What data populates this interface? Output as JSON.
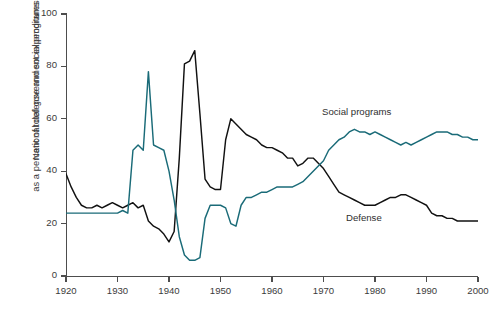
{
  "axes": {
    "ylabel_line1": "National defense and social programs",
    "ylabel_line2": "as a percent of total government expenditures",
    "xlabel": "",
    "yticks": [
      "0",
      "20",
      "40",
      "60",
      "80",
      "100"
    ],
    "xticks": [
      "1920",
      "1930",
      "1940",
      "1950",
      "1960",
      "1970",
      "1980",
      "1990",
      "2000"
    ]
  },
  "labels": {
    "social": "Social programs",
    "defense": "Defense"
  },
  "colors": {
    "social": "#1a6b78",
    "defense": "#111111",
    "axis": "#4d4d4d",
    "text": "#3a3a3a",
    "background": "#ffffff"
  },
  "chart_data": {
    "type": "line",
    "title": "",
    "xlabel": "",
    "ylabel": "National defense and social programs as a percent of total government expenditures",
    "xlim": [
      1920,
      2000
    ],
    "ylim": [
      0,
      100
    ],
    "yticks": [
      0,
      20,
      40,
      60,
      80,
      100
    ],
    "xticks": [
      1920,
      1930,
      1940,
      1950,
      1960,
      1970,
      1980,
      1990,
      2000
    ],
    "grid": false,
    "legend": "inline-labels",
    "series": [
      {
        "name": "Defense",
        "color": "#111111",
        "x": [
          1920,
          1921,
          1922,
          1923,
          1924,
          1925,
          1926,
          1927,
          1928,
          1929,
          1930,
          1931,
          1932,
          1933,
          1934,
          1935,
          1936,
          1937,
          1938,
          1939,
          1940,
          1941,
          1942,
          1943,
          1944,
          1945,
          1946,
          1947,
          1948,
          1949,
          1950,
          1951,
          1952,
          1953,
          1954,
          1955,
          1956,
          1957,
          1958,
          1959,
          1960,
          1961,
          1962,
          1963,
          1964,
          1965,
          1966,
          1967,
          1968,
          1969,
          1970,
          1971,
          1972,
          1973,
          1974,
          1975,
          1976,
          1977,
          1978,
          1979,
          1980,
          1981,
          1982,
          1983,
          1984,
          1985,
          1986,
          1987,
          1988,
          1989,
          1990,
          1991,
          1992,
          1993,
          1994,
          1995,
          1996,
          1997,
          1998,
          1999,
          2000
        ],
        "y": [
          39,
          34,
          30,
          27,
          26,
          26,
          27,
          26,
          27,
          28,
          27,
          26,
          27,
          28,
          26,
          27,
          21,
          19,
          18,
          16,
          13,
          17,
          45,
          81,
          82,
          86,
          62,
          37,
          34,
          33,
          33,
          52,
          60,
          58,
          56,
          54,
          53,
          52,
          50,
          49,
          49,
          48,
          47,
          45,
          45,
          42,
          43,
          45,
          45,
          43,
          41,
          38,
          35,
          32,
          31,
          30,
          29,
          28,
          27,
          27,
          27,
          28,
          29,
          30,
          30,
          31,
          31,
          30,
          29,
          28,
          27,
          24,
          23,
          23,
          22,
          22,
          21,
          21,
          21,
          21,
          21
        ]
      },
      {
        "name": "Social programs",
        "color": "#1a6b78",
        "x": [
          1920,
          1922,
          1924,
          1926,
          1928,
          1930,
          1931,
          1932,
          1933,
          1934,
          1935,
          1936,
          1937,
          1938,
          1939,
          1940,
          1941,
          1942,
          1943,
          1944,
          1945,
          1946,
          1947,
          1948,
          1949,
          1950,
          1951,
          1952,
          1953,
          1954,
          1955,
          1956,
          1957,
          1958,
          1959,
          1960,
          1961,
          1962,
          1963,
          1964,
          1965,
          1966,
          1967,
          1968,
          1969,
          1970,
          1971,
          1972,
          1973,
          1974,
          1975,
          1976,
          1977,
          1978,
          1979,
          1980,
          1981,
          1982,
          1983,
          1984,
          1985,
          1986,
          1987,
          1988,
          1989,
          1990,
          1991,
          1992,
          1993,
          1994,
          1995,
          1996,
          1997,
          1998,
          1999,
          2000
        ],
        "y": [
          24,
          24,
          24,
          24,
          24,
          24,
          25,
          24,
          48,
          50,
          48,
          78,
          50,
          49,
          48,
          40,
          29,
          15,
          8,
          6,
          6,
          7,
          22,
          27,
          27,
          27,
          26,
          20,
          19,
          27,
          30,
          30,
          31,
          32,
          32,
          33,
          34,
          34,
          34,
          34,
          35,
          36,
          38,
          40,
          42,
          44,
          48,
          50,
          52,
          53,
          55,
          56,
          55,
          55,
          54,
          55,
          54,
          53,
          52,
          51,
          50,
          51,
          50,
          51,
          52,
          53,
          54,
          55,
          55,
          55,
          54,
          54,
          53,
          53,
          52,
          52
        ]
      }
    ]
  }
}
